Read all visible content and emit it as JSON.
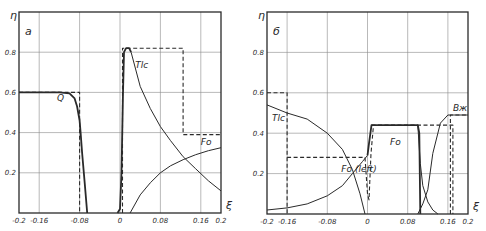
{
  "figure": {
    "colors": {
      "ink": "#2a2a2a",
      "grid": "#8a8a8a",
      "background": "#ffffff"
    }
  },
  "chart_data": [
    {
      "type": "line",
      "panel_label": "a",
      "title": "",
      "xlabel": "ξ",
      "ylabel": "η",
      "xlim": [
        -0.2,
        0.2
      ],
      "ylim": [
        0,
        1.0
      ],
      "grid": true,
      "x_ticks": [
        -0.2,
        -0.16,
        -0.08,
        0,
        0.08,
        0.16,
        0.2
      ],
      "x_tick_labels": [
        "-0.2",
        "-0.16",
        "-0.08",
        "0",
        "0.08",
        "0.16",
        "0.2"
      ],
      "y_ticks": [
        0.2,
        0.4,
        0.6,
        0.8
      ],
      "y_tick_labels": [
        "0.2",
        "0.4",
        "0.6",
        "0.8"
      ],
      "series": [
        {
          "name": "Q",
          "style": "solid-bold",
          "x": [
            -0.2,
            -0.12,
            -0.1,
            -0.09,
            -0.085,
            -0.08,
            -0.078,
            -0.075,
            -0.07,
            -0.065
          ],
          "y": [
            0.6,
            0.6,
            0.595,
            0.57,
            0.53,
            0.46,
            0.4,
            0.3,
            0.15,
            0.0
          ],
          "label_pos": [
            -0.125,
            0.555
          ]
        },
        {
          "name": "Q (ideal)",
          "style": "dashed",
          "x": [
            -0.2,
            -0.08,
            -0.08
          ],
          "y": [
            0.6,
            0.6,
            0.0
          ]
        },
        {
          "name": "Tlc",
          "style": "solid-bold",
          "x": [
            -0.005,
            0.0,
            0.003,
            0.006,
            0.008,
            0.012,
            0.018,
            0.022
          ],
          "y": [
            0.0,
            0.02,
            0.2,
            0.6,
            0.8,
            0.82,
            0.82,
            0.8
          ]
        },
        {
          "name": "Tlc",
          "style": "solid",
          "x": [
            0.022,
            0.04,
            0.06,
            0.08,
            0.1,
            0.125,
            0.15,
            0.175,
            0.2
          ],
          "y": [
            0.8,
            0.63,
            0.52,
            0.43,
            0.36,
            0.28,
            0.22,
            0.16,
            0.11
          ],
          "label_pos": [
            0.03,
            0.72
          ]
        },
        {
          "name": "Tlc (ideal)",
          "style": "dashed",
          "x": [
            0.005,
            0.005,
            0.125,
            0.125,
            0.2
          ],
          "y": [
            0.0,
            0.82,
            0.82,
            0.39,
            0.39
          ]
        },
        {
          "name": "Fo",
          "style": "solid",
          "x": [
            0.02,
            0.04,
            0.06,
            0.08,
            0.1,
            0.125,
            0.15,
            0.175,
            0.2
          ],
          "y": [
            0.0,
            0.09,
            0.15,
            0.2,
            0.235,
            0.265,
            0.29,
            0.31,
            0.325
          ],
          "label_pos": [
            0.16,
            0.34
          ]
        }
      ]
    },
    {
      "type": "line",
      "panel_label": "б",
      "title": "",
      "xlabel": "ξ",
      "ylabel": "η",
      "xlim": [
        -0.2,
        0.2
      ],
      "ylim": [
        0,
        1.0
      ],
      "grid": true,
      "x_ticks": [
        -0.2,
        -0.16,
        -0.08,
        0,
        0.08,
        0.16,
        0.2
      ],
      "x_tick_labels": [
        "-0.2",
        "-0.16",
        "-0.08",
        "0",
        "0.08",
        "0.16",
        "0.2"
      ],
      "y_ticks": [
        0.2,
        0.4,
        0.6,
        0.8
      ],
      "y_tick_labels": [
        "0.2",
        "0.4",
        "0.6",
        "0.8"
      ],
      "series": [
        {
          "name": "Tlc",
          "style": "solid",
          "x": [
            -0.2,
            -0.16,
            -0.12,
            -0.08,
            -0.05,
            -0.03,
            -0.015,
            -0.005
          ],
          "y": [
            0.54,
            0.5,
            0.47,
            0.4,
            0.32,
            0.22,
            0.1,
            0.0
          ],
          "label_pos": [
            -0.19,
            0.46
          ]
        },
        {
          "name": "Tlc (ideal)",
          "style": "dashed",
          "x": [
            -0.2,
            -0.16,
            -0.16
          ],
          "y": [
            0.6,
            0.6,
            0.0
          ]
        },
        {
          "name": "Fo (left)",
          "style": "solid",
          "x": [
            -0.2,
            -0.16,
            -0.12,
            -0.08,
            -0.05,
            -0.03,
            -0.01,
            0.0
          ],
          "y": [
            0.02,
            0.03,
            0.05,
            0.09,
            0.14,
            0.2,
            0.26,
            0.29
          ],
          "label_pos": [
            -0.052,
            0.21
          ]
        },
        {
          "name": "Fo (left ideal)",
          "style": "dashed",
          "x": [
            -0.16,
            -0.005,
            0.0,
            0.003,
            0.007,
            0.012
          ],
          "y": [
            0.28,
            0.28,
            0.1,
            0.07,
            0.3,
            0.44
          ]
        },
        {
          "name": "Fo",
          "style": "solid-bold",
          "x": [
            0.0,
            0.003,
            0.008,
            0.1,
            0.103,
            0.105
          ],
          "y": [
            0.29,
            0.35,
            0.44,
            0.44,
            0.4,
            0.0
          ],
          "label_pos": [
            0.045,
            0.34
          ]
        },
        {
          "name": "Fo (ideal)",
          "style": "dashed",
          "x": [
            0.008,
            0.17,
            0.17,
            0.17
          ],
          "y": [
            0.44,
            0.44,
            0.44,
            0.0
          ]
        },
        {
          "name": "Bж",
          "style": "solid",
          "x": [
            0.1,
            0.11,
            0.12,
            0.13,
            0.145,
            0.16,
            0.2
          ],
          "y": [
            0.0,
            0.05,
            0.12,
            0.3,
            0.45,
            0.49,
            0.49
          ],
          "label_pos": [
            0.17,
            0.51
          ]
        },
        {
          "name": "Bж (decay)",
          "style": "solid",
          "x": [
            0.1,
            0.105,
            0.11,
            0.12,
            0.13,
            0.14
          ],
          "y": [
            0.44,
            0.25,
            0.14,
            0.06,
            0.02,
            0.0
          ]
        },
        {
          "name": "Bж (ideal)",
          "style": "dashed",
          "x": [
            0.165,
            0.165,
            0.2
          ],
          "y": [
            0.0,
            0.49,
            0.49
          ]
        }
      ]
    }
  ],
  "panels": [
    {
      "frame": {
        "x": 19,
        "y": 12,
        "w": 202,
        "h": 201
      }
    },
    {
      "frame": {
        "x": 267,
        "y": 12,
        "w": 201,
        "h": 202
      }
    }
  ]
}
